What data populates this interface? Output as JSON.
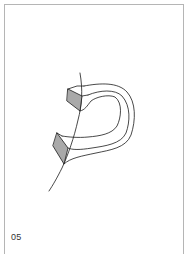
{
  "figure": {
    "label": "05",
    "colors": {
      "stroke": "#1a1a1a",
      "shaded_face": "#a9a9a9",
      "frame": "#b5b5b5",
      "background": "#ffffff"
    }
  }
}
